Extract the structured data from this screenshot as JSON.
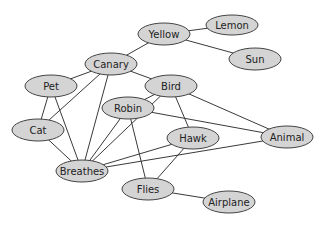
{
  "diagram": {
    "type": "semantic-network",
    "colors": {
      "node_fill": "#d4d4d4",
      "node_stroke": "#444444",
      "edge": "#3a3a3a",
      "text": "#222222",
      "background": "#ffffff"
    },
    "nodes": [
      {
        "id": "yellow",
        "label": "Yellow",
        "cx": 164,
        "cy": 34,
        "rx": 26,
        "ry": 11
      },
      {
        "id": "lemon",
        "label": "Lemon",
        "cx": 232,
        "cy": 25,
        "rx": 26,
        "ry": 10
      },
      {
        "id": "sun",
        "label": "Sun",
        "cx": 255,
        "cy": 59,
        "rx": 26,
        "ry": 11
      },
      {
        "id": "canary",
        "label": "Canary",
        "cx": 111,
        "cy": 64,
        "rx": 26,
        "ry": 11
      },
      {
        "id": "pet",
        "label": "Pet",
        "cx": 51,
        "cy": 86,
        "rx": 26,
        "ry": 11
      },
      {
        "id": "bird",
        "label": "Bird",
        "cx": 171,
        "cy": 86,
        "rx": 26,
        "ry": 11
      },
      {
        "id": "robin",
        "label": "Robin",
        "cx": 128,
        "cy": 108,
        "rx": 26,
        "ry": 11
      },
      {
        "id": "cat",
        "label": "Cat",
        "cx": 38,
        "cy": 130,
        "rx": 26,
        "ry": 11
      },
      {
        "id": "hawk",
        "label": "Hawk",
        "cx": 193,
        "cy": 138,
        "rx": 26,
        "ry": 11
      },
      {
        "id": "animal",
        "label": "Animal",
        "cx": 287,
        "cy": 137,
        "rx": 26,
        "ry": 11
      },
      {
        "id": "breathes",
        "label": "Breathes",
        "cx": 82,
        "cy": 171,
        "rx": 26,
        "ry": 11
      },
      {
        "id": "flies",
        "label": "Flies",
        "cx": 148,
        "cy": 189,
        "rx": 26,
        "ry": 11
      },
      {
        "id": "airplane",
        "label": "Airplane",
        "cx": 229,
        "cy": 202,
        "rx": 26,
        "ry": 11
      }
    ],
    "edges": [
      [
        "yellow",
        "canary"
      ],
      [
        "yellow",
        "lemon"
      ],
      [
        "yellow",
        "sun"
      ],
      [
        "canary",
        "pet"
      ],
      [
        "canary",
        "bird"
      ],
      [
        "canary",
        "cat"
      ],
      [
        "canary",
        "breathes"
      ],
      [
        "pet",
        "cat"
      ],
      [
        "pet",
        "breathes"
      ],
      [
        "cat",
        "breathes"
      ],
      [
        "bird",
        "robin"
      ],
      [
        "bird",
        "hawk"
      ],
      [
        "bird",
        "animal"
      ],
      [
        "bird",
        "breathes"
      ],
      [
        "robin",
        "breathes"
      ],
      [
        "robin",
        "flies"
      ],
      [
        "robin",
        "animal"
      ],
      [
        "hawk",
        "breathes"
      ],
      [
        "hawk",
        "flies"
      ],
      [
        "animal",
        "breathes"
      ],
      [
        "flies",
        "airplane"
      ]
    ]
  }
}
